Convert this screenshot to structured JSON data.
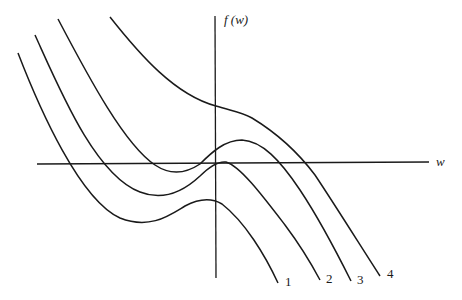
{
  "diagram": {
    "type": "function-family-plot",
    "y_axis_label": "f (w)",
    "x_axis_label": "w",
    "curves": [
      {
        "id": "1",
        "label": "1",
        "description": "cubic-like curve with local min below axis and local max below axis; no positive root near origin"
      },
      {
        "id": "2",
        "label": "2",
        "description": "cubic-like curve with local max touching the horizontal axis near w=0"
      },
      {
        "id": "3",
        "label": "3",
        "description": "cubic-like curve with local min below axis and local max above axis; three roots"
      },
      {
        "id": "4",
        "label": "4",
        "description": "monotone decreasing curve with inflection above the axis; single root"
      }
    ]
  }
}
